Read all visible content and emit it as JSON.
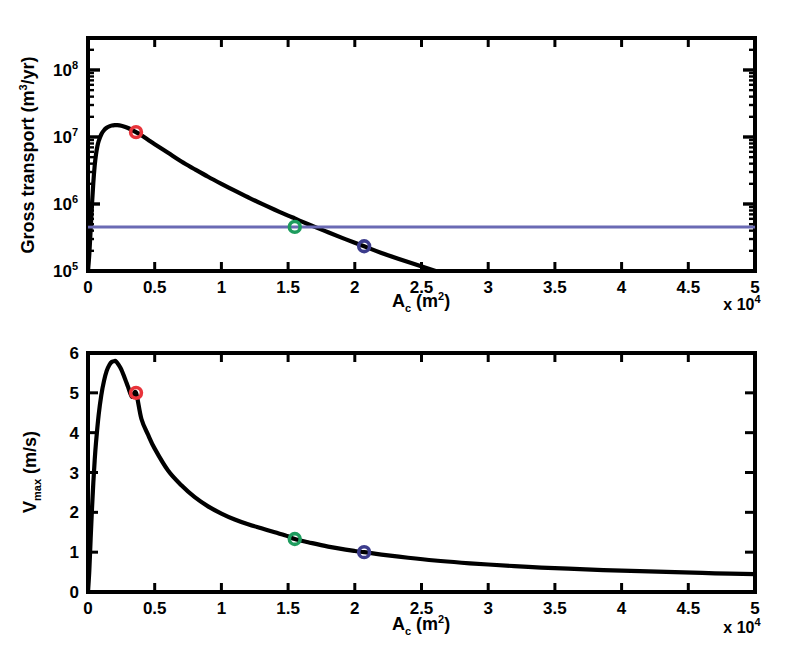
{
  "figure": {
    "background": "#ffffff",
    "curve_color": "#000000",
    "line_color": "#6a6ab4",
    "marker_red": "#e8333a",
    "marker_green": "#1e9c5e",
    "marker_blue": "#3c3c8c"
  },
  "chart_data": [
    {
      "type": "line",
      "title": "",
      "panel": "top",
      "xlabel": "A_c (m^2)",
      "xlabel_base": "A",
      "xlabel_sub": "c",
      "xlabel_unit_open": " (m",
      "xlabel_unit_sup": "2",
      "xlabel_unit_close": ")",
      "ylabel": "Gross transport (m^3/yr)",
      "ylabel_base": "Gross transport (m",
      "ylabel_sup": "3",
      "ylabel_tail": "/yr)",
      "x_multiplier": "x 10",
      "x_multiplier_exp": "4",
      "xlim": [
        0,
        5
      ],
      "ylim": [
        100000,
        300000000
      ],
      "yscale": "log",
      "xscale": "linear",
      "grid": false,
      "legend": "none",
      "xticks": [
        0,
        0.5,
        1,
        1.5,
        2,
        2.5,
        3,
        3.5,
        4,
        4.5,
        5
      ],
      "xticklabels": [
        "0",
        "0.5",
        "1",
        "1.5",
        "2",
        "2.5",
        "3",
        "3.5",
        "4",
        "4.5",
        "5"
      ],
      "yticks": [
        100000,
        1000000,
        10000000,
        100000000
      ],
      "yticklabels": [
        "10",
        "10",
        "10",
        "10"
      ],
      "ytick_exponents": [
        "5",
        "6",
        "7",
        "8"
      ],
      "series": [
        {
          "name": "gross-transport-curve",
          "color": "#000000",
          "x": [
            0.0,
            0.01,
            0.02,
            0.03,
            0.04,
            0.05,
            0.06,
            0.07,
            0.08,
            0.1,
            0.12,
            0.14,
            0.16,
            0.18,
            0.2,
            0.22,
            0.25,
            0.28,
            0.3,
            0.33,
            0.36,
            0.4,
            0.45,
            0.5,
            0.6,
            0.7,
            0.8,
            0.9,
            1.0,
            1.1,
            1.2,
            1.3,
            1.4,
            1.5,
            1.55,
            1.6,
            1.7,
            1.8,
            1.9,
            2.0,
            2.07,
            2.2,
            2.4,
            2.6,
            2.8,
            2.95
          ],
          "y": [
            100000,
            180000,
            420000,
            1000000,
            2100000,
            3700000,
            5500000,
            7200000,
            8700000,
            11000000,
            12600000,
            13700000,
            14400000,
            14800000,
            15000000,
            15000000,
            14700000,
            14100000,
            13600000,
            12700000,
            11800000,
            10600000,
            9100000,
            7800000,
            5800000,
            4300000,
            3300000,
            2550000,
            2000000,
            1580000,
            1260000,
            1010000,
            820000,
            670000,
            610000,
            550000,
            455000,
            378000,
            315000,
            264000,
            234000,
            186000,
            136000,
            101000,
            76000,
            62000
          ]
        },
        {
          "name": "threshold-line",
          "color": "#6a6ab4",
          "kind": "horizontal",
          "y_value": 455000,
          "x_from": 0,
          "x_to": 5
        }
      ],
      "markers": [
        {
          "name": "marker-red",
          "x": 0.36,
          "y": 11800000,
          "color": "#e8333a"
        },
        {
          "name": "marker-green",
          "x": 1.55,
          "y": 455000,
          "color": "#1e9c5e"
        },
        {
          "name": "marker-blue",
          "x": 2.07,
          "y": 234000,
          "color": "#3c3c8c"
        }
      ]
    },
    {
      "type": "line",
      "title": "",
      "panel": "bottom",
      "xlabel": "A_c (m^2)",
      "xlabel_base": "A",
      "xlabel_sub": "c",
      "xlabel_unit_open": " (m",
      "xlabel_unit_sup": "2",
      "xlabel_unit_close": ")",
      "ylabel": "V_max (m/s)",
      "ylabel_base": "V",
      "ylabel_sub": "max",
      "ylabel_tail": " (m/s)",
      "x_multiplier": "x 10",
      "x_multiplier_exp": "4",
      "xlim": [
        0,
        5
      ],
      "ylim": [
        0,
        6
      ],
      "yscale": "linear",
      "xscale": "linear",
      "grid": false,
      "legend": "none",
      "xticks": [
        0,
        0.5,
        1,
        1.5,
        2,
        2.5,
        3,
        3.5,
        4,
        4.5,
        5
      ],
      "xticklabels": [
        "0",
        "0.5",
        "1",
        "1.5",
        "2",
        "2.5",
        "3",
        "3.5",
        "4",
        "4.5",
        "5"
      ],
      "yticks": [
        0,
        1,
        2,
        3,
        4,
        5,
        6
      ],
      "yticklabels": [
        "0",
        "1",
        "2",
        "3",
        "4",
        "5",
        "6"
      ],
      "series": [
        {
          "name": "vmax-curve",
          "color": "#000000",
          "x": [
            0.0,
            0.01,
            0.02,
            0.03,
            0.04,
            0.05,
            0.06,
            0.08,
            0.1,
            0.12,
            0.14,
            0.16,
            0.18,
            0.2,
            0.21,
            0.23,
            0.25,
            0.28,
            0.3,
            0.33,
            0.36,
            0.4,
            0.45,
            0.5,
            0.6,
            0.7,
            0.8,
            0.9,
            1.0,
            1.1,
            1.2,
            1.3,
            1.4,
            1.5,
            1.55,
            1.65,
            1.8,
            2.0,
            2.07,
            2.2,
            2.4,
            2.6,
            2.8,
            3.0,
            3.3,
            3.6,
            4.0,
            4.4,
            4.7,
            5.0
          ],
          "y": [
            0.0,
            0.55,
            1.35,
            2.1,
            2.75,
            3.3,
            3.75,
            4.45,
            4.95,
            5.3,
            5.55,
            5.7,
            5.78,
            5.8,
            5.79,
            5.7,
            5.58,
            5.33,
            5.15,
            4.9,
            5.0,
            4.35,
            3.95,
            3.6,
            3.05,
            2.68,
            2.38,
            2.15,
            1.97,
            1.82,
            1.7,
            1.6,
            1.5,
            1.4,
            1.33,
            1.25,
            1.14,
            1.03,
            1.0,
            0.94,
            0.86,
            0.79,
            0.735,
            0.69,
            0.63,
            0.585,
            0.535,
            0.5,
            0.47,
            0.45
          ]
        }
      ],
      "markers": [
        {
          "name": "marker-red",
          "x": 0.36,
          "y": 5.0,
          "color": "#e8333a"
        },
        {
          "name": "marker-green",
          "x": 1.55,
          "y": 1.33,
          "color": "#1e9c5e"
        },
        {
          "name": "marker-blue",
          "x": 2.07,
          "y": 1.0,
          "color": "#3c3c8c"
        }
      ]
    }
  ]
}
